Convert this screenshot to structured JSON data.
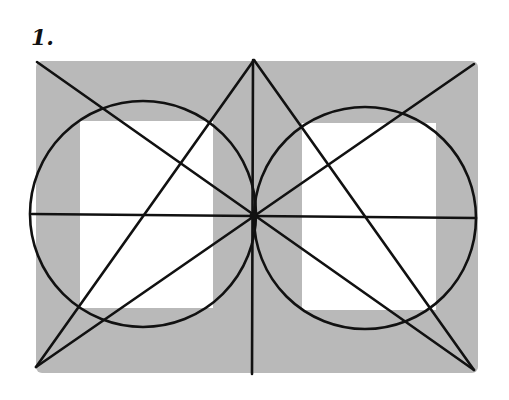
{
  "figure": {
    "label": "1.",
    "colors": {
      "background": "#ffffff",
      "frame_fill": "#b9b9b9",
      "window_fill": "#ffffff",
      "line": "#111111"
    },
    "frame": {
      "x": 36,
      "y": 61,
      "width": 442,
      "height": 312,
      "rx": 6
    },
    "windows": [
      {
        "name": "left-window",
        "x": 80,
        "y": 121,
        "width": 133,
        "height": 187
      },
      {
        "name": "right-window",
        "x": 302,
        "y": 123,
        "width": 134,
        "height": 187
      }
    ],
    "circles": [
      {
        "name": "left-circle",
        "cx": 143,
        "cy": 214,
        "r": 113
      },
      {
        "name": "right-circle",
        "cx": 365,
        "cy": 218,
        "r": 111
      }
    ],
    "lines": [
      {
        "name": "vertical-axis",
        "x1": 253,
        "y1": 60,
        "x2": 252,
        "y2": 374
      },
      {
        "name": "horizontal-axis",
        "x1": 32,
        "y1": 214,
        "x2": 476,
        "y2": 218
      },
      {
        "name": "diagonal-tl-br",
        "x1": 37,
        "y1": 62,
        "x2": 474,
        "y2": 370
      },
      {
        "name": "diagonal-tr-bl",
        "x1": 474,
        "y1": 64,
        "x2": 36,
        "y2": 367
      },
      {
        "name": "apex-to-bottom-left",
        "x1": 254,
        "y1": 60,
        "x2": 36,
        "y2": 367
      },
      {
        "name": "apex-to-bottom-right",
        "x1": 254,
        "y1": 60,
        "x2": 474,
        "y2": 370
      }
    ],
    "center_point": {
      "cx": 253,
      "cy": 216
    }
  }
}
